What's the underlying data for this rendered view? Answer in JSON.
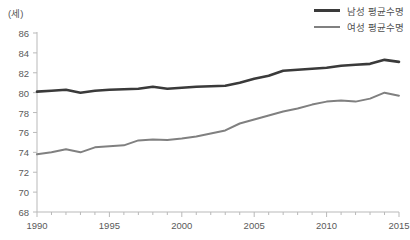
{
  "axis_unit_label": "(세)",
  "legend": {
    "position": "top-right",
    "items": [
      {
        "label": "남성 평균수명",
        "color": "#3a3a3a",
        "key": "male"
      },
      {
        "label": "여성 평균수명",
        "color": "#808080",
        "key": "female"
      }
    ]
  },
  "chart_data": {
    "type": "line",
    "title": "",
    "subtitle": "",
    "xlabel": "",
    "ylabel": "(세)",
    "xlim": [
      1990,
      2015
    ],
    "ylim": [
      68,
      86
    ],
    "y_ticks": [
      68,
      70,
      72,
      74,
      76,
      78,
      80,
      82,
      84,
      86
    ],
    "x_ticks_major": [
      1990,
      1995,
      2000,
      2005,
      2010,
      2015
    ],
    "x_tick_labels": [
      "1990",
      "1995",
      "2000",
      "2005",
      "2010",
      "2015"
    ],
    "y_tick_labels": [
      "68",
      "70",
      "72",
      "74",
      "76",
      "78",
      "80",
      "82",
      "84",
      "86"
    ],
    "x_minor_tick_step": 1,
    "grid": false,
    "legend_position": "top-right",
    "x": [
      1990,
      1991,
      1992,
      1993,
      1994,
      1995,
      1996,
      1997,
      1998,
      1999,
      2000,
      2001,
      2002,
      2003,
      2004,
      2005,
      2006,
      2007,
      2008,
      2009,
      2010,
      2011,
      2012,
      2013,
      2014,
      2015
    ],
    "series": [
      {
        "name": "남성 평균수명",
        "color": "#3a3a3a",
        "width": 2.6,
        "values": [
          80.1,
          80.2,
          80.3,
          80.0,
          80.2,
          80.3,
          80.35,
          80.4,
          80.6,
          80.4,
          80.5,
          80.6,
          80.65,
          80.7,
          81.0,
          81.4,
          81.7,
          82.2,
          82.3,
          82.4,
          82.5,
          82.7,
          82.8,
          82.9,
          83.3,
          83.1
        ]
      },
      {
        "name": "여성 평균수명",
        "color": "#808080",
        "width": 2.0,
        "values": [
          73.8,
          74.0,
          74.3,
          74.0,
          74.5,
          74.6,
          74.7,
          75.2,
          75.3,
          75.25,
          75.4,
          75.6,
          75.9,
          76.2,
          76.9,
          77.3,
          77.7,
          78.1,
          78.4,
          78.8,
          79.1,
          79.2,
          79.1,
          79.4,
          80.0,
          79.7
        ]
      }
    ]
  }
}
